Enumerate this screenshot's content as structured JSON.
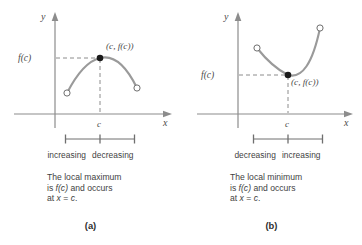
{
  "figure": {
    "title_alt": "Local maximum and local minimum diagrams",
    "panels": [
      {
        "id": "a",
        "letter": "(a)",
        "axis": {
          "y_label": "y",
          "x_label": "x",
          "value_label": "f(c)",
          "tick_label": "c"
        },
        "point_label": "(c, f(c))",
        "trend_left": "increasing",
        "trend_right": "decreasing",
        "description": [
          "The local maximum",
          "is f(c) and occurs",
          "at x = c."
        ],
        "description_parts": {
          "line1_plain": "The local maximum",
          "line2_pre": "is ",
          "line2_math": "f(c)",
          "line2_post": " and occurs",
          "line3_pre": "at ",
          "line3_math_x": "x",
          "line3_eq": " = ",
          "line3_math_c": "c",
          "line3_post": "."
        },
        "extreme_type": "maximum"
      },
      {
        "id": "b",
        "letter": "(b)",
        "axis": {
          "y_label": "y",
          "x_label": "x",
          "value_label": "f(c)",
          "tick_label": "c"
        },
        "point_label": "(c, f(c))",
        "trend_left": "decreasing",
        "trend_right": "increasing",
        "description": [
          "The local minimum",
          "is f(c) and occurs",
          "at x = c."
        ],
        "description_parts": {
          "line1_plain": "The local minimum",
          "line2_pre": "is ",
          "line2_math": "f(c)",
          "line2_post": " and occurs",
          "line3_pre": "at ",
          "line3_math_x": "x",
          "line3_eq": " = ",
          "line3_math_c": "c",
          "line3_post": "."
        },
        "extreme_type": "minimum"
      }
    ]
  },
  "colors": {
    "axis": "#8c8c8c",
    "curve": "#9a9a9a",
    "dashed": "#8c8c8c",
    "point_fill": "#1a1a1a",
    "text": "#3f3f3f",
    "background": "#ffffff"
  }
}
